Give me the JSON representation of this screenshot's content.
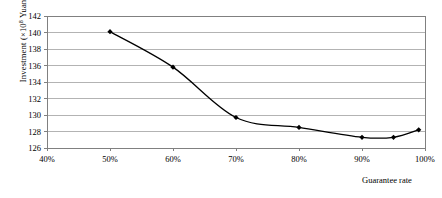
{
  "chart_data": {
    "type": "line",
    "title": "",
    "subtitle": "",
    "xlabel": "Guarantee rate",
    "ylabel_prefix": "Investment (×10",
    "ylabel_exponent": "8",
    "ylabel_suffix": " Yuan)",
    "ylabel_full": "Investment (×10⁸ Yuan)",
    "x": [
      50,
      60,
      70,
      80,
      90,
      95,
      99
    ],
    "x_display": [
      "50%",
      "60%",
      "70%",
      "80%",
      "90%",
      "95%",
      "99%"
    ],
    "values": [
      140.1,
      135.8,
      129.7,
      128.5,
      127.3,
      127.3,
      128.2
    ],
    "series": [
      {
        "name": "Investment",
        "x": [
          50,
          60,
          70,
          80,
          90,
          95,
          99
        ],
        "values": [
          140.1,
          135.8,
          129.7,
          128.5,
          127.3,
          127.3,
          128.2
        ]
      }
    ],
    "xlim": [
      40,
      100
    ],
    "ylim": [
      126,
      142
    ],
    "xticks": [
      40,
      50,
      60,
      70,
      80,
      90,
      100
    ],
    "xtick_labels": [
      "40%",
      "50%",
      "60%",
      "70%",
      "80%",
      "90%",
      "100%"
    ],
    "yticks": [
      126,
      128,
      130,
      132,
      134,
      136,
      138,
      140,
      142
    ],
    "ytick_labels": [
      "126",
      "128",
      "130",
      "132",
      "134",
      "136",
      "138",
      "140",
      "142"
    ],
    "grid": true,
    "grid_axis": "y",
    "legend": false,
    "legend_position": "none",
    "line_color": "#000000",
    "marker_color": "#000000",
    "marker_style": "filled-diamond",
    "grid_color": "#b3b3b3",
    "axis_color": "#808080",
    "background": "#ffffff"
  }
}
